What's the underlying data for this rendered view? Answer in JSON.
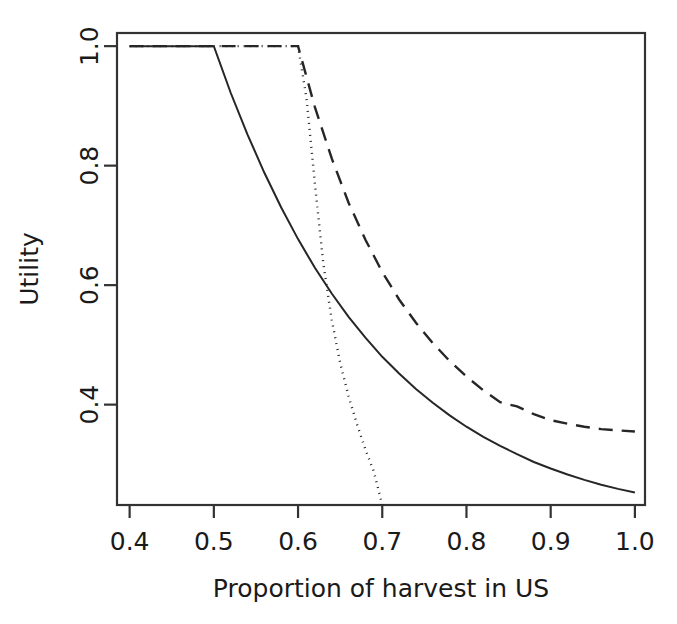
{
  "chart_data": {
    "type": "line",
    "title": "",
    "xlabel": "Proportion of harvest in US",
    "ylabel": "Utility",
    "xlim": [
      0.385,
      1.012
    ],
    "ylim": [
      0.232,
      1.022
    ],
    "xticks": [
      0.4,
      0.5,
      0.6,
      0.7,
      0.8,
      0.9,
      1.0
    ],
    "xticklabels": [
      "0.4",
      "0.5",
      "0.6",
      "0.7",
      "0.8",
      "0.9",
      "1.0"
    ],
    "yticks": [
      0.4,
      0.6,
      0.8,
      1.0
    ],
    "yticklabels": [
      "0.4",
      "0.6",
      "0.8",
      "1.0"
    ],
    "grid": false,
    "legend": "none",
    "box": "full-rectangle",
    "series": [
      {
        "name": "solid-curve",
        "linestyle": "solid",
        "color": "#262626",
        "linewidth": 2.0,
        "dasharray": "none",
        "x": [
          0.4,
          0.42,
          0.44,
          0.46,
          0.48,
          0.5,
          0.52,
          0.54,
          0.56,
          0.58,
          0.6,
          0.62,
          0.64,
          0.66,
          0.68,
          0.7,
          0.72,
          0.74,
          0.76,
          0.78,
          0.8,
          0.82,
          0.84,
          0.86,
          0.88,
          0.9,
          0.92,
          0.94,
          0.96,
          0.98,
          1.0
        ],
        "y": [
          1.0,
          1.0,
          1.0,
          1.0,
          1.0,
          1.0,
          0.922,
          0.852,
          0.788,
          0.73,
          0.677,
          0.629,
          0.586,
          0.547,
          0.512,
          0.48,
          0.452,
          0.426,
          0.403,
          0.382,
          0.363,
          0.346,
          0.331,
          0.317,
          0.304,
          0.293,
          0.283,
          0.274,
          0.266,
          0.259,
          0.253
        ]
      },
      {
        "name": "dotted-curve",
        "linestyle": "dotted",
        "color": "#262626",
        "linewidth": 2.4,
        "dasharray": "1,5",
        "x": [
          0.4,
          0.45,
          0.5,
          0.55,
          0.58,
          0.6,
          0.61,
          0.62,
          0.63,
          0.64,
          0.65,
          0.66,
          0.67,
          0.68,
          0.69,
          0.7
        ],
        "y": [
          1.0,
          1.0,
          1.0,
          1.0,
          1.0,
          1.0,
          0.913,
          0.77,
          0.636,
          0.542,
          0.47,
          0.414,
          0.367,
          0.325,
          0.288,
          0.232
        ]
      },
      {
        "name": "dashed-curve",
        "linestyle": "dashed",
        "color": "#262626",
        "linewidth": 2.4,
        "dasharray": "14,9",
        "x": [
          0.4,
          0.45,
          0.5,
          0.55,
          0.58,
          0.6,
          0.62,
          0.64,
          0.66,
          0.68,
          0.7,
          0.72,
          0.74,
          0.76,
          0.78,
          0.8,
          0.82,
          0.84,
          0.86,
          0.88,
          0.9,
          0.92,
          0.94,
          0.96,
          0.98,
          1.0
        ],
        "y": [
          1.0,
          1.0,
          1.0,
          1.0,
          1.0,
          1.0,
          0.898,
          0.812,
          0.738,
          0.676,
          0.622,
          0.576,
          0.537,
          0.503,
          0.473,
          0.447,
          0.424,
          0.404,
          0.397,
          0.384,
          0.374,
          0.368,
          0.363,
          0.359,
          0.357,
          0.355
        ]
      }
    ]
  }
}
